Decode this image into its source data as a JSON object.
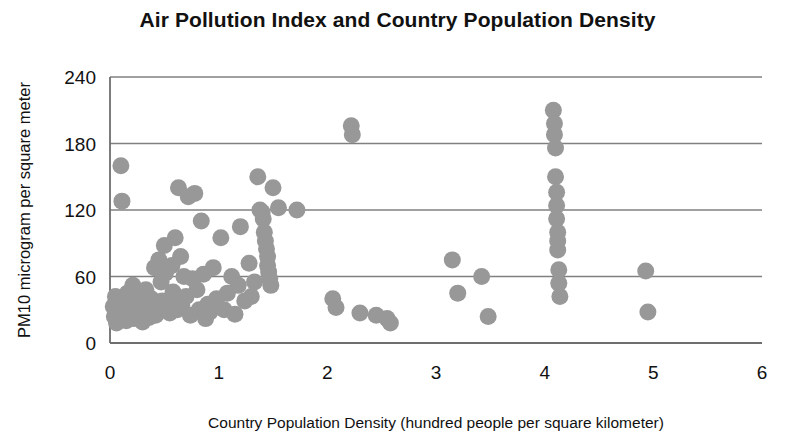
{
  "chart_data": {
    "type": "scatter",
    "title": "Air Pollution Index and Country Population Density",
    "xlabel": "Country Population Density  (hundred people per square kilometer)",
    "ylabel": "PM10  microgram per square meter",
    "xlim": [
      0,
      6
    ],
    "ylim": [
      0,
      240
    ],
    "xticks": [
      "0",
      "1",
      "2",
      "3",
      "4",
      "5",
      "6"
    ],
    "yticks": [
      "0",
      "60",
      "120",
      "180",
      "240"
    ],
    "grid": "horizontal",
    "legend": "none",
    "marker": {
      "shape": "circle",
      "color": "#989898",
      "size_px": 17
    },
    "series": [
      {
        "name": "Countries",
        "points": [
          [
            0.03,
            33
          ],
          [
            0.04,
            24
          ],
          [
            0.05,
            42
          ],
          [
            0.06,
            18
          ],
          [
            0.08,
            30
          ],
          [
            0.1,
            160
          ],
          [
            0.11,
            128
          ],
          [
            0.12,
            38
          ],
          [
            0.13,
            27
          ],
          [
            0.15,
            20
          ],
          [
            0.16,
            45
          ],
          [
            0.18,
            34
          ],
          [
            0.2,
            29
          ],
          [
            0.21,
            52
          ],
          [
            0.22,
            22
          ],
          [
            0.24,
            37
          ],
          [
            0.26,
            31
          ],
          [
            0.27,
            26
          ],
          [
            0.29,
            44
          ],
          [
            0.3,
            19
          ],
          [
            0.32,
            36
          ],
          [
            0.33,
            48
          ],
          [
            0.35,
            28
          ],
          [
            0.36,
            23
          ],
          [
            0.38,
            40
          ],
          [
            0.4,
            33
          ],
          [
            0.41,
            68
          ],
          [
            0.42,
            25
          ],
          [
            0.44,
            30
          ],
          [
            0.45,
            75
          ],
          [
            0.47,
            55
          ],
          [
            0.48,
            38
          ],
          [
            0.5,
            88
          ],
          [
            0.51,
            63
          ],
          [
            0.53,
            35
          ],
          [
            0.55,
            27
          ],
          [
            0.57,
            70
          ],
          [
            0.58,
            46
          ],
          [
            0.6,
            95
          ],
          [
            0.62,
            30
          ],
          [
            0.63,
            140
          ],
          [
            0.65,
            78
          ],
          [
            0.66,
            34
          ],
          [
            0.68,
            60
          ],
          [
            0.7,
            42
          ],
          [
            0.72,
            132
          ],
          [
            0.74,
            25
          ],
          [
            0.76,
            58
          ],
          [
            0.78,
            135
          ],
          [
            0.8,
            48
          ],
          [
            0.82,
            30
          ],
          [
            0.84,
            110
          ],
          [
            0.86,
            62
          ],
          [
            0.88,
            22
          ],
          [
            0.9,
            35
          ],
          [
            0.92,
            28
          ],
          [
            0.95,
            68
          ],
          [
            0.98,
            40
          ],
          [
            1.02,
            95
          ],
          [
            1.05,
            30
          ],
          [
            1.08,
            45
          ],
          [
            1.12,
            60
          ],
          [
            1.15,
            26
          ],
          [
            1.18,
            52
          ],
          [
            1.2,
            105
          ],
          [
            1.24,
            38
          ],
          [
            1.28,
            72
          ],
          [
            1.3,
            42
          ],
          [
            1.33,
            55
          ],
          [
            1.36,
            150
          ],
          [
            1.38,
            120
          ],
          [
            1.4,
            118
          ],
          [
            1.41,
            112
          ],
          [
            1.42,
            100
          ],
          [
            1.43,
            92
          ],
          [
            1.44,
            85
          ],
          [
            1.45,
            78
          ],
          [
            1.45,
            70
          ],
          [
            1.46,
            64
          ],
          [
            1.47,
            58
          ],
          [
            1.48,
            52
          ],
          [
            1.5,
            140
          ],
          [
            1.55,
            122
          ],
          [
            1.72,
            120
          ],
          [
            2.05,
            40
          ],
          [
            2.08,
            32
          ],
          [
            2.22,
            196
          ],
          [
            2.23,
            188
          ],
          [
            2.3,
            27
          ],
          [
            2.45,
            25
          ],
          [
            2.55,
            22
          ],
          [
            2.58,
            18
          ],
          [
            3.15,
            75
          ],
          [
            3.2,
            45
          ],
          [
            3.42,
            60
          ],
          [
            3.48,
            24
          ],
          [
            4.08,
            210
          ],
          [
            4.09,
            198
          ],
          [
            4.09,
            188
          ],
          [
            4.1,
            176
          ],
          [
            4.1,
            150
          ],
          [
            4.11,
            136
          ],
          [
            4.11,
            124
          ],
          [
            4.11,
            112
          ],
          [
            4.12,
            100
          ],
          [
            4.12,
            92
          ],
          [
            4.12,
            84
          ],
          [
            4.13,
            66
          ],
          [
            4.13,
            54
          ],
          [
            4.14,
            42
          ],
          [
            4.93,
            65
          ],
          [
            4.95,
            28
          ]
        ]
      }
    ]
  },
  "axes_geometry": {
    "plot_left_px": 110,
    "plot_right_px": 762,
    "plot_top_px": 77,
    "plot_bottom_px": 343
  },
  "colors": {
    "marker": "#989898",
    "gridline": "#808080",
    "axis": "#6e6e6e",
    "text": "#111111",
    "background": "#ffffff"
  }
}
